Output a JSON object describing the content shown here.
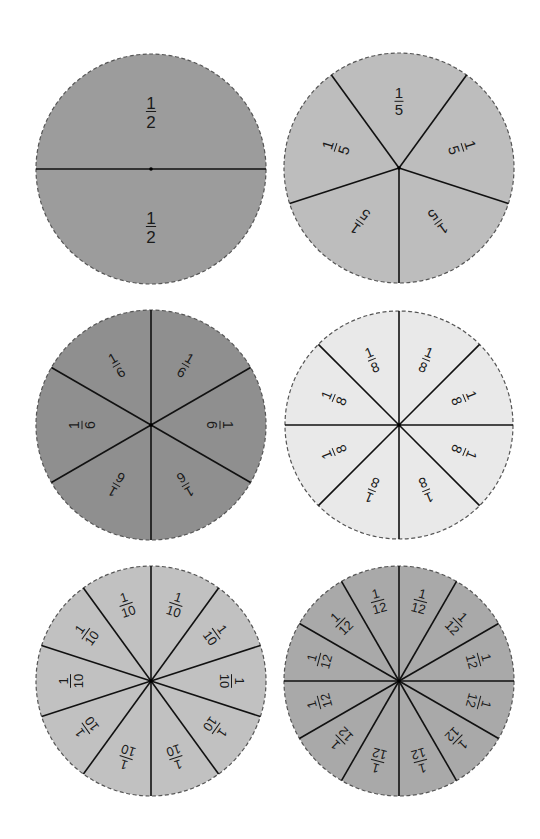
{
  "page": {
    "width": 540,
    "height": 839,
    "background": "#ffffff"
  },
  "circles": [
    {
      "id": "halves",
      "cx": 151,
      "cy": 169,
      "r": 115,
      "parts": 2,
      "label_num": "1",
      "label_den": "2",
      "fill": "#9c9c9c",
      "label_dist": 0.5,
      "font": 17
    },
    {
      "id": "fifths",
      "cx": 399,
      "cy": 168,
      "r": 115,
      "parts": 5,
      "label_num": "1",
      "label_den": "5",
      "fill": "#bdbdbd",
      "label_dist": 0.58,
      "font": 15
    },
    {
      "id": "sixths",
      "cx": 151,
      "cy": 425,
      "r": 115,
      "parts": 6,
      "label_num": "1",
      "label_den": "6",
      "fill": "#8f8f8f",
      "label_dist": 0.6,
      "font": 14
    },
    {
      "id": "eighths",
      "cx": 399,
      "cy": 425,
      "r": 114,
      "parts": 8,
      "label_num": "1",
      "label_den": "8",
      "fill": "#e9e9e9",
      "label_dist": 0.62,
      "font": 14
    },
    {
      "id": "tenths",
      "cx": 151,
      "cy": 681,
      "r": 115,
      "parts": 10,
      "label_num": "1",
      "label_den": "10",
      "fill": "#c1c1c1",
      "label_dist": 0.7,
      "font": 13
    },
    {
      "id": "twelfths",
      "cx": 399,
      "cy": 681,
      "r": 115,
      "parts": 12,
      "label_num": "1",
      "label_den": "12",
      "fill": "#a9a9a9",
      "label_dist": 0.72,
      "font": 13
    }
  ],
  "line_color": "#111111",
  "rim_color": "#555555"
}
